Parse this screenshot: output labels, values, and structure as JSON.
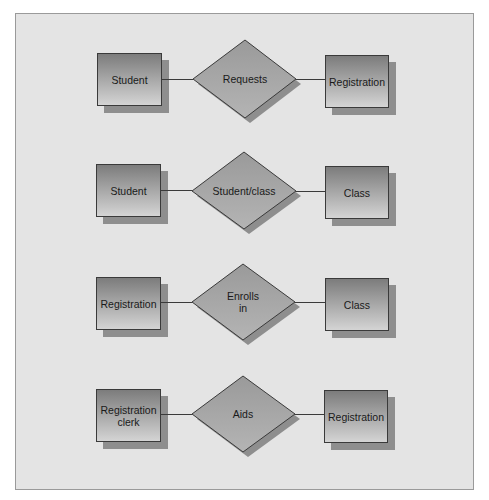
{
  "diagram": {
    "type": "entity-relationship",
    "colors": {
      "frame_bg": "#e4e4e4",
      "frame_border": "#9a9a9a",
      "entity_gradient_top": "#7c7c7c",
      "entity_gradient_bottom": "#d4d4d4",
      "relationship_fill": "#a6a6a6",
      "shadow": "#8e8e8e",
      "line": "#3a3a3a"
    },
    "rows": [
      {
        "left_entity": {
          "label": "Student"
        },
        "relationship": {
          "label": "Requests"
        },
        "right_entity": {
          "label": "Registration"
        }
      },
      {
        "left_entity": {
          "label": "Student"
        },
        "relationship": {
          "label": "Student/class"
        },
        "right_entity": {
          "label": "Class"
        }
      },
      {
        "left_entity": {
          "label": "Registration"
        },
        "relationship": {
          "label_line1": "Enrolls",
          "label_line2": "in"
        },
        "right_entity": {
          "label": "Class"
        }
      },
      {
        "left_entity": {
          "label_line1": "Registration",
          "label_line2": "clerk"
        },
        "relationship": {
          "label": "Aids"
        },
        "right_entity": {
          "label": "Registration"
        }
      }
    ]
  }
}
